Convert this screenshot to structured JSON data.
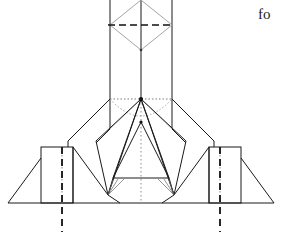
{
  "figure": {
    "canvas": {
      "width": 282,
      "height": 232
    },
    "background_color": "#ffffff",
    "stroke_colors": {
      "solid": "#1a1a1a",
      "light": "#8f8f8f",
      "dotted": "#6f6f6f",
      "dashed": "#111111"
    },
    "stroke_widths": {
      "solid": 1.0,
      "light": 0.8,
      "dotted": 0.9,
      "dashed": 1.6
    },
    "axes": {
      "center_x": 141,
      "ground_line_y": 203,
      "shoulder_y": 99,
      "column_left_x": 110,
      "column_right_x": 172,
      "column_top_y": 0,
      "column_bottom_y": 129
    },
    "guides": {
      "dashed_vertical_left_x": 62,
      "dashed_vertical_right_x": 220,
      "dashed_vertical_top_y": 147,
      "dashed_vertical_bottom_y": 232,
      "dotted_vertical_left_x": 62,
      "dotted_vertical_right_x": 220,
      "dotted_center_x": 141,
      "dashed_horizontal_y": 25
    },
    "parts": [
      {
        "name": "upper-column",
        "description": "Vertical rectangular shaft from top edge to shoulder"
      },
      {
        "name": "inscribed-diamond",
        "description": "Rhombus inscribed in the top of the shaft"
      },
      {
        "name": "shoulder-hub",
        "description": "Central node where bracing lines converge"
      },
      {
        "name": "left-shoulder-panel",
        "description": "Angled panel sloping down-left from the shoulder"
      },
      {
        "name": "right-shoulder-panel",
        "description": "Angled panel sloping down-right from the shoulder"
      },
      {
        "name": "left-foot-block",
        "description": "Rectangular left footing block"
      },
      {
        "name": "right-foot-block",
        "description": "Rectangular right footing block"
      },
      {
        "name": "left-outer-wedge",
        "description": "Triangular outer wedge at left of base"
      },
      {
        "name": "right-outer-wedge",
        "description": "Triangular outer wedge at right of base"
      },
      {
        "name": "center-base-trapezoid",
        "description": "Central trapezoidal base element"
      },
      {
        "name": "ground-line",
        "description": "Horizontal ground reference line"
      }
    ]
  },
  "caption": {
    "fragment_text": "fo",
    "note": "Text fragment clipped at the right edge of the image"
  }
}
